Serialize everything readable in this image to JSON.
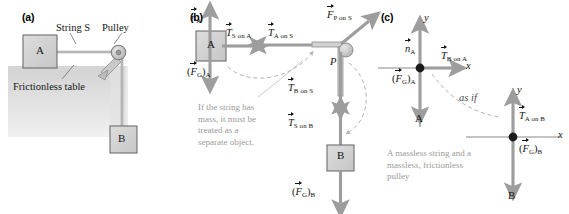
{
  "figure": {
    "panels": [
      {
        "id": "a",
        "letter": "(a)"
      },
      {
        "id": "b",
        "letter": "(b)"
      },
      {
        "id": "c",
        "letter": "(c)"
      }
    ]
  },
  "panel_a": {
    "block_a_label": "A",
    "block_b_label": "B",
    "string_label": "String S",
    "pulley_label": "Pulley",
    "table_label": "Frictionless table"
  },
  "panel_b": {
    "block_a_label": "A",
    "block_b_label": "B",
    "pulley_point_label": "P",
    "note": "If the string has\nmass, it must be\ntreated as a\nseparate object.",
    "forces": [
      {
        "name": "normal-on-a",
        "symbol": "n",
        "sub": "A",
        "paren": false,
        "direction": "up"
      },
      {
        "name": "tension-s-on-a",
        "symbol": "T",
        "sub": "S on A",
        "paren": false,
        "direction": "right"
      },
      {
        "name": "tension-a-on-s",
        "symbol": "T",
        "sub": "A on S",
        "paren": false,
        "direction": "left"
      },
      {
        "name": "force-p-on-s",
        "symbol": "F",
        "sub": "P on S",
        "paren": false,
        "direction": "up-right"
      },
      {
        "name": "gravity-on-a",
        "symbol": "F",
        "sub": "G",
        "paren": true,
        "outer_sub": "A",
        "direction": "down"
      },
      {
        "name": "tension-b-on-s",
        "symbol": "T",
        "sub": "B on S",
        "paren": false,
        "direction": "down"
      },
      {
        "name": "tension-s-on-b",
        "symbol": "T",
        "sub": "S on B",
        "paren": false,
        "direction": "up"
      },
      {
        "name": "gravity-on-b",
        "symbol": "F",
        "sub": "G",
        "paren": true,
        "outer_sub": "B",
        "direction": "down"
      }
    ]
  },
  "panel_c": {
    "object_a_label": "A",
    "object_b_label": "B",
    "axis_x_label": "x",
    "axis_y_label": "y",
    "as_if_label": "as if",
    "note": "A massless string and a\nmassless, frictionless\npulley",
    "forces": [
      {
        "name": "normal-on-a",
        "symbol": "n",
        "sub": "A",
        "paren": false,
        "direction": "up"
      },
      {
        "name": "tension-b-on-a",
        "symbol": "T",
        "sub": "B on A",
        "paren": false,
        "direction": "right"
      },
      {
        "name": "gravity-on-a",
        "symbol": "F",
        "sub": "G",
        "paren": true,
        "outer_sub": "A",
        "direction": "down"
      },
      {
        "name": "tension-a-on-b",
        "symbol": "T",
        "sub": "A on B",
        "paren": false,
        "direction": "up"
      },
      {
        "name": "gravity-on-b",
        "symbol": "F",
        "sub": "G",
        "paren": true,
        "outer_sub": "B",
        "direction": "down"
      }
    ]
  },
  "colors": {
    "block_fill": "#d2d2d2",
    "block_stroke": "#6e6e6e",
    "arrow_gray": "#9d9d9d",
    "table_gray": "#d8d8d8",
    "axis_gray": "#8a8a8a",
    "note_gray": "#9a9a9a",
    "dashed_gray": "#b0b0b0",
    "text_black": "#141414"
  }
}
